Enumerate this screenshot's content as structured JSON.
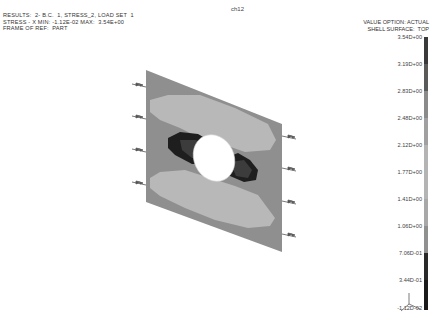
{
  "viewport": {
    "title": "ch12"
  },
  "header": {
    "line1": "RESULTS:  2- B.C.  1, STRESS_2, LOAD SET  1",
    "line2": "STRESS - X MIN: -1.12E-02 MAX:  3.54E+00",
    "line3": "FRAME OF REF:  PART"
  },
  "legend": {
    "line1": "VALUE OPTION: ACTUAL",
    "line2": "SHELL SURFACE:  TOP",
    "ticks": [
      "3.54D+00",
      "3.19D+00",
      "2.83D+00",
      "2.48D+00",
      "2.12D+00",
      "1.77D+00",
      "1.41D+00",
      "1.06D+00",
      "7.06D-01",
      "3.44D-01",
      "-1.12D-02"
    ],
    "band_colors": [
      "#3a3a3a",
      "#5a5a5a",
      "#8a8a8a",
      "#a0a0a0",
      "#b4b4b4",
      "#b4b4b4",
      "#a8a8a8",
      "#909090",
      "#2a2a2a",
      "#1a1a1a"
    ]
  },
  "model": {
    "plate_color": "#8f8f8f",
    "high_zone_color": "#b8b8b8",
    "low_zone_color": "#1e1e1e",
    "mid_dark_color": "#3c3c3c",
    "hole_color": "#ffffff",
    "left_load_arrows": 4,
    "right_load_arrows": 4
  }
}
